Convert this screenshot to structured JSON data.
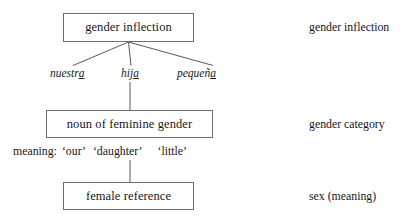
{
  "diagram": {
    "background_color": "#ffffff",
    "box_border_color": "#6e6e70",
    "line_color": "#46464a",
    "text_color": "#17171a",
    "nodes": [
      {
        "id": "top",
        "label": "gender inflection"
      },
      {
        "id": "middle",
        "label": "noun of feminine gender"
      },
      {
        "id": "bottom",
        "label": "female reference"
      }
    ],
    "words": [
      {
        "id": "nuestra",
        "stem": "nuestr",
        "mark": "a"
      },
      {
        "id": "hija",
        "stem": "hij",
        "mark": "a"
      },
      {
        "id": "pequena",
        "stem": "pequeñ",
        "mark": "a"
      }
    ],
    "gloss": {
      "label": "meaning:",
      "items": [
        "‘our’",
        "‘daughter’",
        "‘little’"
      ]
    },
    "tier_labels": [
      {
        "id": "tier-0",
        "label": "gender inflection"
      },
      {
        "id": "tier-1",
        "label": "gender category"
      },
      {
        "id": "tier-2",
        "label": "sex (meaning)"
      }
    ]
  }
}
